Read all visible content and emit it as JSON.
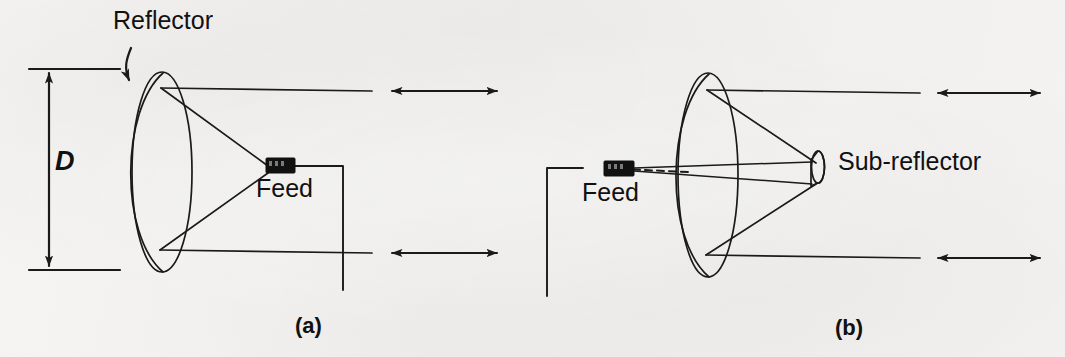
{
  "figure": {
    "background_color": "#f3f2f0",
    "ink_color": "#1a1a1a",
    "panels": [
      {
        "id": "a",
        "caption": "(a)",
        "type": "front-fed parabolic reflector",
        "labels": {
          "reflector": "Reflector",
          "feed": "Feed",
          "diameter": "D"
        }
      },
      {
        "id": "b",
        "caption": "(b)",
        "type": "cassegrain dual reflector",
        "labels": {
          "feed": "Feed",
          "sub_reflector": "Sub-reflector"
        }
      }
    ],
    "annotations": {
      "dimension_label": "D",
      "reflector_label": "Reflector",
      "feed_label_a": "Feed",
      "feed_label_b": "Feed",
      "sub_reflector_label": "Sub-reflector",
      "caption_a": "(a)",
      "caption_b": "(b)"
    }
  }
}
